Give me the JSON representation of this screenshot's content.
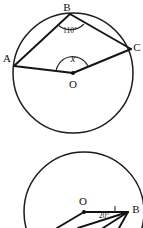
{
  "figures": [
    {
      "id": "circle-theorem-top",
      "shape": "circle",
      "center_label": "O",
      "points": [
        {
          "name": "A",
          "label": "A"
        },
        {
          "name": "B",
          "label": "B"
        },
        {
          "name": "C",
          "label": "C"
        }
      ],
      "angles": [
        {
          "at": "B",
          "label": "110°",
          "type": "inscribed-angle"
        },
        {
          "at": "O",
          "label": "x",
          "type": "central-angle"
        }
      ],
      "segments": [
        "B-A",
        "B-C",
        "A-O",
        "O-C"
      ]
    },
    {
      "id": "circle-theorem-bottom",
      "shape": "circle",
      "center_label": "O",
      "points": [
        {
          "name": "B",
          "label": "B"
        }
      ],
      "angles": [
        {
          "at": "B",
          "label": "20°",
          "type": "angle-with-right-mark"
        }
      ],
      "segments": [
        "O-B",
        "O-lower-left",
        "B-lower-left",
        "B-lower"
      ],
      "note": "figure cropped at bottom edge of image"
    }
  ],
  "colors": {
    "stroke": "#1c1c1c",
    "background": "#ffffff",
    "label": "#101010"
  }
}
